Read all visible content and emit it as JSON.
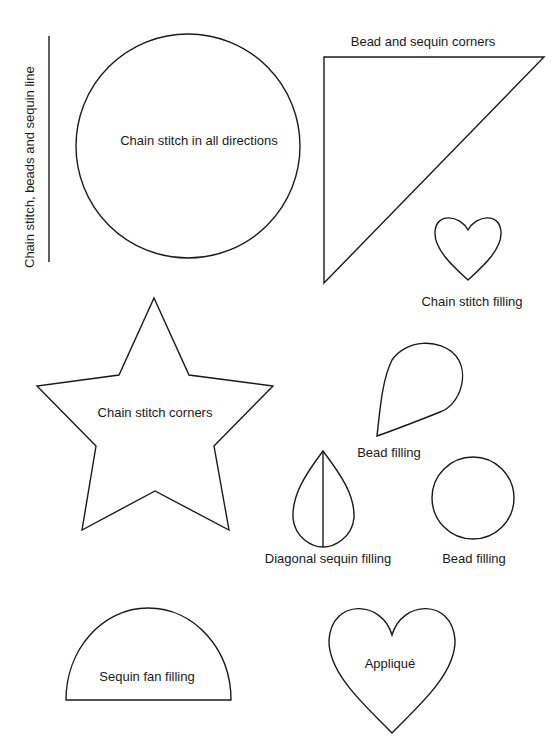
{
  "diagram": {
    "labels": {
      "line": "Chain stitch, beads and sequin line",
      "circle": "Chain stitch in all directions",
      "triangle": "Bead and sequin corners",
      "small_heart": "Chain stitch filling",
      "star": "Chain stitch corners",
      "teardrop": "Bead filling",
      "split_teardrop": "Diagonal sequin filling",
      "small_circle": "Bead filling",
      "semicircle": "Sequin fan filling",
      "large_heart": "Appliqué"
    },
    "stroke_color": "#1a1a1a",
    "background_color": "#ffffff"
  }
}
